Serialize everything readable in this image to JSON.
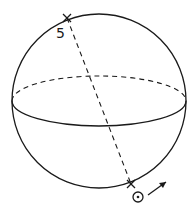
{
  "diagram": {
    "type": "celestial-sphere",
    "sphere": {
      "cx": 99,
      "cy": 101,
      "r": 87
    },
    "equator": {
      "cx": 99,
      "cy": 101,
      "rx": 87,
      "ry": 25,
      "back_half": "dashed",
      "front_half": "solid"
    },
    "axis": {
      "x1": 67,
      "y1": 18,
      "x2": 131,
      "y2": 184,
      "style": "dashed"
    },
    "labels": {
      "top_pole": "5",
      "bottom_symbol": "⊙"
    },
    "markers": [
      {
        "name": "top-pole-marker",
        "x": 67,
        "y": 18,
        "glyph": "×"
      },
      {
        "name": "bottom-pole-marker",
        "x": 131,
        "y": 184,
        "glyph": "×"
      }
    ],
    "arrow": {
      "x1": 148,
      "y1": 195,
      "x2": 166,
      "y2": 182,
      "meaning": "direction of motion"
    }
  }
}
